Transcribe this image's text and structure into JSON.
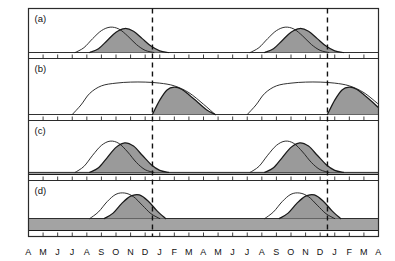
{
  "figure": {
    "ylabel": "Number of detached viable seeds",
    "xlabel": ""
  },
  "axis": {
    "month_labels": [
      "A",
      "M",
      "J",
      "J",
      "A",
      "S",
      "O",
      "N",
      "D",
      "J",
      "F",
      "M",
      "A",
      "M",
      "J",
      "J",
      "A",
      "S",
      "O",
      "N",
      "D",
      "J",
      "F",
      "M",
      "A"
    ]
  },
  "panels": [
    {
      "id": "a",
      "label": "(a)"
    },
    {
      "id": "b",
      "label": "(b)"
    },
    {
      "id": "c",
      "label": "(c)"
    },
    {
      "id": "d",
      "label": "(d)"
    }
  ],
  "colors": {
    "fill_gray": "#9a9a9a",
    "band_gray": "#a3a3a3",
    "line": "#1a1a1a",
    "frame": "#2b2b2b",
    "dashed": "#111111",
    "background": "#ffffff"
  },
  "chart_data": {
    "type": "area",
    "title": "",
    "xlabel": "",
    "ylabel": "Number of detached viable seeds",
    "grid": false,
    "legend_position": "none",
    "x_tick_labels": [
      "A",
      "M",
      "J",
      "J",
      "A",
      "S",
      "O",
      "N",
      "D",
      "J",
      "F",
      "M",
      "A",
      "M",
      "J",
      "J",
      "A",
      "S",
      "O",
      "N",
      "D",
      "J",
      "F",
      "M",
      "A"
    ],
    "x_range": [
      0,
      24
    ],
    "xlim": [
      0,
      24
    ],
    "ylim": [
      0,
      1
    ],
    "annotations": [
      {
        "type": "vline",
        "style": "dashed",
        "x": 8.5,
        "label": "year boundary D/J"
      },
      {
        "type": "vline",
        "style": "dashed",
        "x": 20.5,
        "label": "year boundary D/J"
      }
    ],
    "panels": [
      {
        "id": "a",
        "label": "(a)",
        "baseline": 0,
        "series": [
          {
            "name": "seed shed (open curve)",
            "style": "open-line",
            "fill": "none",
            "x": [
              3.2,
              3.8,
              4.4,
              5.0,
              5.6,
              6.2,
              6.8,
              7.4,
              8.0,
              8.6
            ],
            "values": [
              0.0,
              0.18,
              0.52,
              0.82,
              0.95,
              0.88,
              0.62,
              0.3,
              0.08,
              0.0
            ]
          },
          {
            "name": "viable seeds (shaded curve)",
            "style": "filled",
            "fill": "#9a9a9a",
            "x": [
              4.2,
              4.8,
              5.4,
              6.0,
              6.6,
              7.2,
              7.8,
              8.4,
              9.0,
              9.6
            ],
            "values": [
              0.0,
              0.14,
              0.45,
              0.76,
              0.9,
              0.8,
              0.52,
              0.24,
              0.06,
              0.0
            ]
          },
          {
            "name": "seed shed (open curve) cycle 2",
            "style": "open-line",
            "fill": "none",
            "x": [
              15.2,
              15.8,
              16.4,
              17.0,
              17.6,
              18.2,
              18.8,
              19.4,
              20.0,
              20.6
            ],
            "values": [
              0.0,
              0.18,
              0.52,
              0.82,
              0.95,
              0.88,
              0.62,
              0.3,
              0.08,
              0.0
            ]
          },
          {
            "name": "viable seeds (shaded curve) cycle 2",
            "style": "filled",
            "fill": "#9a9a9a",
            "x": [
              16.2,
              16.8,
              17.4,
              18.0,
              18.6,
              19.2,
              19.8,
              20.4,
              21.0,
              21.6
            ],
            "values": [
              0.0,
              0.14,
              0.45,
              0.76,
              0.9,
              0.8,
              0.52,
              0.24,
              0.06,
              0.0
            ]
          }
        ]
      },
      {
        "id": "b",
        "label": "(b)",
        "baseline": 0,
        "series": [
          {
            "name": "seed shed (broad plateau open curve)",
            "style": "open-line",
            "fill": "none",
            "x": [
              3.0,
              3.6,
              4.2,
              5.0,
              6.0,
              7.0,
              8.0,
              9.0,
              10.0,
              11.0,
              12.0,
              12.8
            ],
            "values": [
              0.0,
              0.28,
              0.62,
              0.84,
              0.92,
              0.95,
              0.95,
              0.92,
              0.84,
              0.64,
              0.3,
              0.0
            ]
          },
          {
            "name": "viable seeds (shaded, after dormancy break)",
            "style": "filled",
            "fill": "#9a9a9a",
            "x": [
              8.5,
              9.0,
              9.5,
              10.0,
              10.5,
              11.0,
              11.6,
              12.2,
              12.8
            ],
            "values": [
              0.0,
              0.42,
              0.72,
              0.8,
              0.74,
              0.58,
              0.36,
              0.14,
              0.0
            ]
          },
          {
            "name": "seed shed (broad plateau open curve) cycle 2",
            "style": "open-line",
            "fill": "none",
            "x": [
              15.0,
              15.6,
              16.2,
              17.0,
              18.0,
              19.0,
              20.0,
              21.0,
              22.0,
              23.0,
              24.0
            ],
            "values": [
              0.0,
              0.28,
              0.62,
              0.84,
              0.92,
              0.95,
              0.95,
              0.92,
              0.84,
              0.64,
              0.3
            ]
          },
          {
            "name": "viable seeds (shaded, after dormancy break) cycle 2",
            "style": "filled",
            "fill": "#9a9a9a",
            "x": [
              20.5,
              21.0,
              21.5,
              22.0,
              22.5,
              23.0,
              23.6,
              24.0
            ],
            "values": [
              0.0,
              0.42,
              0.72,
              0.8,
              0.74,
              0.58,
              0.36,
              0.2
            ]
          }
        ]
      },
      {
        "id": "c",
        "label": "(c)",
        "baseline": 0.07,
        "baseline_note": "thin persistent seed bank band across full x range",
        "series": [
          {
            "name": "seed shed (open curve)",
            "style": "open-line",
            "fill": "none",
            "x": [
              3.2,
              3.8,
              4.4,
              5.0,
              5.6,
              6.2,
              6.8,
              7.4,
              8.0,
              8.6
            ],
            "values": [
              0.0,
              0.18,
              0.52,
              0.82,
              0.95,
              0.88,
              0.62,
              0.3,
              0.08,
              0.0
            ]
          },
          {
            "name": "viable seeds (shaded curve)",
            "style": "filled",
            "fill": "#9a9a9a",
            "x": [
              4.2,
              4.8,
              5.4,
              6.0,
              6.6,
              7.2,
              7.8,
              8.4,
              9.0,
              9.6
            ],
            "values": [
              0.0,
              0.14,
              0.45,
              0.76,
              0.9,
              0.8,
              0.52,
              0.24,
              0.06,
              0.0
            ]
          },
          {
            "name": "seed shed (open curve) cycle 2",
            "style": "open-line",
            "fill": "none",
            "x": [
              15.2,
              15.8,
              16.4,
              17.0,
              17.6,
              18.2,
              18.8,
              19.4,
              20.0,
              20.6
            ],
            "values": [
              0.0,
              0.18,
              0.52,
              0.82,
              0.95,
              0.88,
              0.62,
              0.3,
              0.08,
              0.0
            ]
          },
          {
            "name": "viable seeds (shaded curve) cycle 2",
            "style": "filled",
            "fill": "#9a9a9a",
            "x": [
              16.2,
              16.8,
              17.4,
              18.0,
              18.6,
              19.2,
              19.8,
              20.4,
              21.0,
              21.6
            ],
            "values": [
              0.0,
              0.14,
              0.45,
              0.76,
              0.9,
              0.8,
              0.52,
              0.24,
              0.06,
              0.0
            ]
          }
        ]
      },
      {
        "id": "d",
        "label": "(d)",
        "baseline": 0.42,
        "baseline_note": "thick persistent seed bank band across full x range",
        "series": [
          {
            "name": "seed shed (open curve)",
            "style": "open-line",
            "fill": "none",
            "x": [
              4.2,
              4.8,
              5.4,
              6.0,
              6.6,
              7.2,
              7.8,
              8.4,
              9.0
            ],
            "values": [
              0.0,
              0.22,
              0.56,
              0.8,
              0.84,
              0.72,
              0.44,
              0.16,
              0.0
            ]
          },
          {
            "name": "viable seeds (shaded curve)",
            "style": "filled",
            "fill": "#9a9a9a",
            "x": [
              5.2,
              5.8,
              6.4,
              7.0,
              7.6,
              8.2,
              8.8,
              9.4
            ],
            "values": [
              0.0,
              0.18,
              0.5,
              0.74,
              0.78,
              0.58,
              0.26,
              0.0
            ]
          },
          {
            "name": "seed shed (open curve) cycle 2",
            "style": "open-line",
            "fill": "none",
            "x": [
              16.2,
              16.8,
              17.4,
              18.0,
              18.6,
              19.2,
              19.8,
              20.4,
              21.0
            ],
            "values": [
              0.0,
              0.22,
              0.56,
              0.8,
              0.84,
              0.72,
              0.44,
              0.16,
              0.0
            ]
          },
          {
            "name": "viable seeds (shaded curve) cycle 2",
            "style": "filled",
            "fill": "#9a9a9a",
            "x": [
              17.2,
              17.8,
              18.4,
              19.0,
              19.6,
              20.2,
              20.8,
              21.4
            ],
            "values": [
              0.0,
              0.18,
              0.5,
              0.74,
              0.78,
              0.58,
              0.26,
              0.0
            ]
          }
        ]
      }
    ]
  }
}
